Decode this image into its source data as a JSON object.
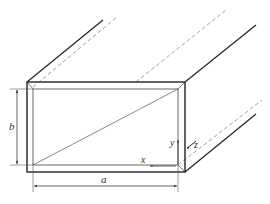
{
  "figure": {
    "labels": {
      "width": "a",
      "height": "b",
      "x_axis": "x",
      "y_axis": "y",
      "z_axis": "z"
    },
    "colors": {
      "line": "#222222",
      "thin_line": "#555555",
      "dashed_line": "#888888",
      "background": "#ffffff"
    }
  }
}
